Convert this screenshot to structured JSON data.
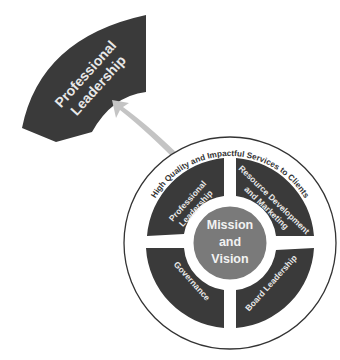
{
  "diagram": {
    "callout": {
      "label_line1": "Professional",
      "label_line2": "Leadership"
    },
    "outer_ring_label": "High Quality and Impactful Services to Clients",
    "center": {
      "line1": "Mission",
      "line2": "and",
      "line3": "Vision"
    },
    "segments": [
      {
        "id": "professional-leadership",
        "line1": "Professional",
        "line2": "Leadership"
      },
      {
        "id": "resource-development",
        "line1": "Resource Development",
        "line2": "and Marketing"
      },
      {
        "id": "board-leadership",
        "line1": "Board Leadership"
      },
      {
        "id": "governance",
        "line1": "Governance"
      }
    ],
    "colors": {
      "segment_fill": "#3a3a3a",
      "center_fill": "#7a7a7a",
      "arrow_fill": "#c4c4c4",
      "outline": "#333333"
    }
  }
}
